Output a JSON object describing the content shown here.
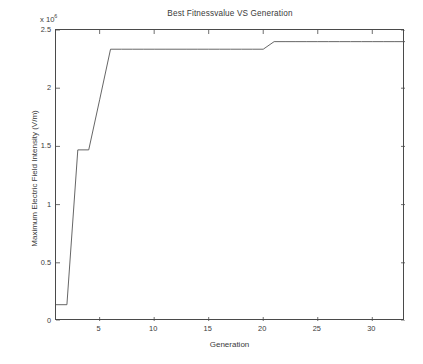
{
  "chart_data": {
    "type": "line",
    "title": "Best Fitnessvalue VS Generation",
    "xlabel": "Generation",
    "ylabel": "Maximum Electric Field Intensity (V/m)",
    "y_multiplier_prefix": "x 10",
    "y_multiplier_exponent": "6",
    "y_scale_factor": 1000000,
    "xlim": [
      1,
      33
    ],
    "ylim": [
      0,
      2.5
    ],
    "grid": false,
    "legend": null,
    "xticks": [
      5,
      10,
      15,
      20,
      25,
      30
    ],
    "xtick_labels": [
      "5",
      "10",
      "15",
      "20",
      "25",
      "30"
    ],
    "yticks": [
      0,
      0.5,
      1,
      1.5,
      2,
      2.5
    ],
    "ytick_labels": [
      "0",
      "0.5",
      "1",
      "1.5",
      "2",
      "2.5"
    ],
    "line_color": "#555555",
    "series": [
      {
        "name": "Best Fitnessvalue",
        "x": [
          1,
          2,
          3,
          4,
          5,
          6,
          7,
          8,
          9,
          10,
          11,
          12,
          13,
          14,
          15,
          16,
          17,
          18,
          19,
          20,
          21,
          22,
          23,
          24,
          25,
          26,
          27,
          28,
          29,
          30,
          31,
          32,
          33
        ],
        "values": [
          0.14,
          0.14,
          1.47,
          1.47,
          1.9,
          2.335,
          2.335,
          2.335,
          2.335,
          2.335,
          2.335,
          2.335,
          2.335,
          2.335,
          2.335,
          2.335,
          2.335,
          2.335,
          2.335,
          2.335,
          2.4,
          2.4,
          2.4,
          2.4,
          2.4,
          2.4,
          2.4,
          2.4,
          2.4,
          2.4,
          2.4,
          2.4,
          2.4
        ]
      }
    ]
  }
}
